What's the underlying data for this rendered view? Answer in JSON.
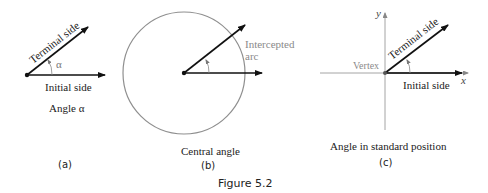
{
  "figure": {
    "caption": "Figure 5.2",
    "panels": [
      {
        "id": "a",
        "label": "(a)",
        "title": "Angle α",
        "terminal_side": "Terminal side",
        "initial_side": "Initial side",
        "angle_symbol": "α"
      },
      {
        "id": "b",
        "label": "(b)",
        "title": "Central angle",
        "arc_label_line1": "Intercepted",
        "arc_label_line2": "arc"
      },
      {
        "id": "c",
        "label": "(c)",
        "title": "Angle in standard position",
        "terminal_side": "Terminal side",
        "initial_side": "Initial side",
        "vertex": "Vertex",
        "x_axis": "x",
        "y_axis": "y"
      }
    ]
  },
  "colors": {
    "ink": "#111111",
    "gray_text": "#8a8a8a",
    "circle": "#8f8f8f",
    "axis": "#9a9a9a"
  }
}
